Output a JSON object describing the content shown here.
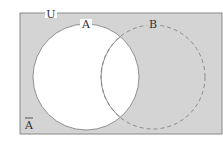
{
  "diagram": {
    "type": "venn",
    "universe_label": "U",
    "sets": [
      {
        "name": "A",
        "label": "A",
        "outline": "solid"
      },
      {
        "name": "B",
        "label": "B",
        "outline": "dashed"
      }
    ],
    "shaded_region_label": "A",
    "shaded_region_meaning": "complement of A",
    "colors": {
      "shaded": "#d4d4d4",
      "unshaded": "#ffffff",
      "stroke": "#777777",
      "text": "#333333"
    }
  }
}
